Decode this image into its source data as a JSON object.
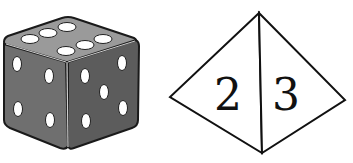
{
  "figure": {
    "cube_die": {
      "top_face_pips": 6,
      "left_face_pips": 4,
      "right_face_pips": 5,
      "colors": {
        "top": "#8f8f8f",
        "left": "#6e6e6e",
        "right": "#5f5f5f",
        "pip": "#ffffff",
        "outline": "#1a1a1a"
      }
    },
    "tetrahedron_die": {
      "left_face_label": "2",
      "right_face_label": "3",
      "colors": {
        "fill": "#ffffff",
        "stroke": "#111111"
      }
    }
  }
}
